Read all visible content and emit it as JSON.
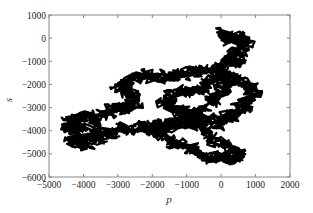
{
  "chart_data": {
    "type": "line",
    "title": "",
    "xlabel": "p",
    "ylabel": "s",
    "xlim": [
      -5000,
      2000
    ],
    "ylim": [
      -6000,
      1000
    ],
    "xticks": [
      -5000,
      -4000,
      -3000,
      -2000,
      -1000,
      0,
      1000,
      2000
    ],
    "yticks": [
      1000,
      0,
      -1000,
      -2000,
      -3000,
      -4000,
      -5000,
      -6000
    ],
    "xtick_labels": [
      "−5000",
      "−4000",
      "−3000",
      "−2000",
      "−1000",
      "0",
      "1000",
      "2000"
    ],
    "ytick_labels": [
      "1000",
      "0",
      "−1000",
      "−2000",
      "−3000",
      "−4000",
      "−5000",
      "−6000"
    ],
    "grid": false,
    "legend": null,
    "series": [
      {
        "name": "random walk trajectory",
        "color": "#000000",
        "description": "2D random walk trace in (p, s) plane, dense black cloud",
        "x": [
          -100,
          200,
          300,
          600,
          700,
          400,
          500,
          200,
          0,
          -300,
          -700,
          -1000,
          -1300,
          -1500,
          -1800,
          -2200,
          -2500,
          -2800,
          -3000,
          -2700,
          -2500,
          -2600,
          -2800,
          -3100,
          -3300,
          -3600,
          -3900,
          -4200,
          -4500,
          -4300,
          -4000,
          -3700,
          -3900,
          -4200,
          -4400,
          -4100,
          -3800,
          -3500,
          -3200,
          -2900,
          -2500,
          -2200,
          -1900,
          -1600,
          -1300,
          -1000,
          -800,
          -600,
          -300,
          -100,
          100,
          300,
          500,
          700,
          900,
          1000,
          700,
          400,
          100,
          -200,
          -500,
          -800,
          -1100,
          -1400,
          -1600,
          -1400,
          -1100,
          -800,
          -500,
          -200,
          100,
          400,
          500,
          300,
          0,
          -300,
          -600,
          -900,
          -1200,
          -1500,
          -1800,
          -2000,
          -1700,
          -1400,
          -1100,
          -800,
          -500,
          -300,
          -100,
          100,
          200,
          0,
          -200
        ],
        "y": [
          200,
          100,
          -100,
          0,
          -300,
          -600,
          -900,
          -1000,
          -1200,
          -1400,
          -1300,
          -1500,
          -1700,
          -1600,
          -1800,
          -1500,
          -1700,
          -1900,
          -2100,
          -2300,
          -2600,
          -2900,
          -3100,
          -3000,
          -3300,
          -3500,
          -3400,
          -3500,
          -3700,
          -4000,
          -3900,
          -4100,
          -4400,
          -4300,
          -4500,
          -4600,
          -4400,
          -4300,
          -4100,
          -3900,
          -4000,
          -3800,
          -4100,
          -3900,
          -3700,
          -3500,
          -3800,
          -3600,
          -3400,
          -3700,
          -3500,
          -3300,
          -3100,
          -2800,
          -2500,
          -2200,
          -2000,
          -1800,
          -1600,
          -1900,
          -2100,
          -2400,
          -2200,
          -2500,
          -2800,
          -3000,
          -3200,
          -3500,
          -3900,
          -4300,
          -4600,
          -4900,
          -5100,
          -5300,
          -5100,
          -5200,
          -5000,
          -4800,
          -4600,
          -4400,
          -4200,
          -3900,
          -3700,
          -3600,
          -3400,
          -3200,
          -3000,
          -2700,
          -2400,
          -2100,
          -1800,
          -1500,
          -1200
        ]
      }
    ]
  }
}
